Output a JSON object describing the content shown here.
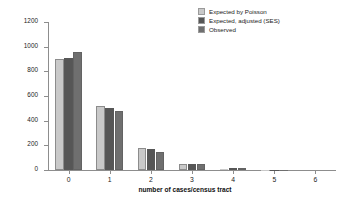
{
  "chart_data": {
    "type": "bar",
    "title": "",
    "xlabel": "number of cases/census tract",
    "ylabel": "number of census tracts",
    "categories": [
      "0",
      "1",
      "2",
      "3",
      "4",
      "5",
      "6"
    ],
    "ylim": [
      0,
      1200
    ],
    "yticks": [
      0,
      200,
      400,
      600,
      800,
      1000,
      1200
    ],
    "grid": false,
    "legend_position": "top-right",
    "series": [
      {
        "name": "Expected by Poisson",
        "color": "#c9c9c9",
        "values": [
          900,
          515,
          175,
          45,
          8,
          1,
          0
        ]
      },
      {
        "name": "Expected, adjusted (SES)",
        "color": "#565656",
        "values": [
          910,
          500,
          170,
          50,
          10,
          2,
          0
        ]
      },
      {
        "name": "Observed",
        "color": "#6f6f6f",
        "values": [
          960,
          475,
          145,
          45,
          10,
          2,
          0
        ]
      }
    ]
  }
}
